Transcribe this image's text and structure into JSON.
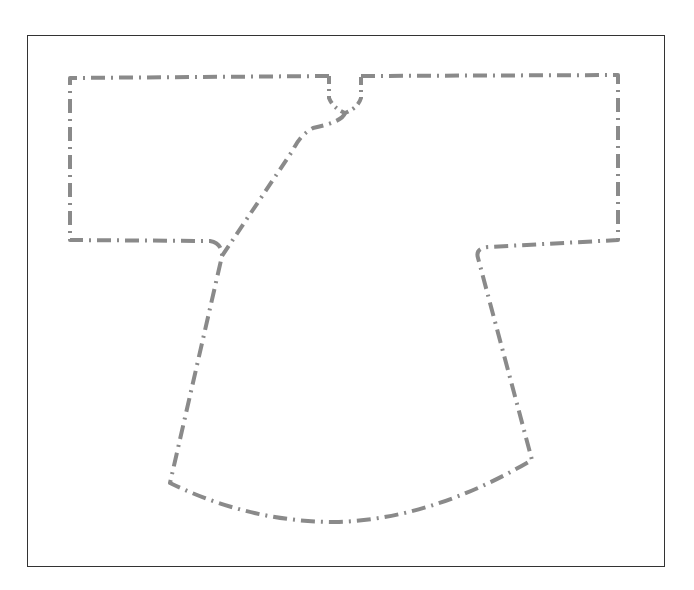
{
  "diagram": {
    "type": "garment-pattern-outline",
    "colors": {
      "frame": "#333333",
      "outline": "#8a8a8a",
      "background": "#ffffff"
    },
    "line_style": "dash-dot",
    "parts": [
      "sleeves",
      "neckline",
      "front-overlap",
      "body",
      "curved-hem"
    ]
  }
}
